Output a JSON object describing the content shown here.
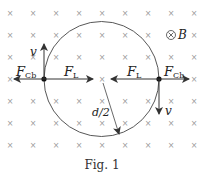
{
  "figure": {
    "caption": "Fig. 1",
    "field_label": "B",
    "field_symbol": "⊗",
    "grid_symbol": "×",
    "labels": {
      "v_top": "v",
      "v_bottom": "v",
      "F_Cb_left": "F",
      "F_Cb_left_sub": "Cb",
      "F_L_left": "F",
      "F_L_left_sub": "L",
      "F_L_right": "F",
      "F_L_right_sub": "L",
      "F_Cb_right": "F",
      "F_Cb_right_sub": "Cb",
      "radius": "d/2"
    },
    "colors": {
      "line": "#333333",
      "cross": "#9a9a9a"
    }
  }
}
